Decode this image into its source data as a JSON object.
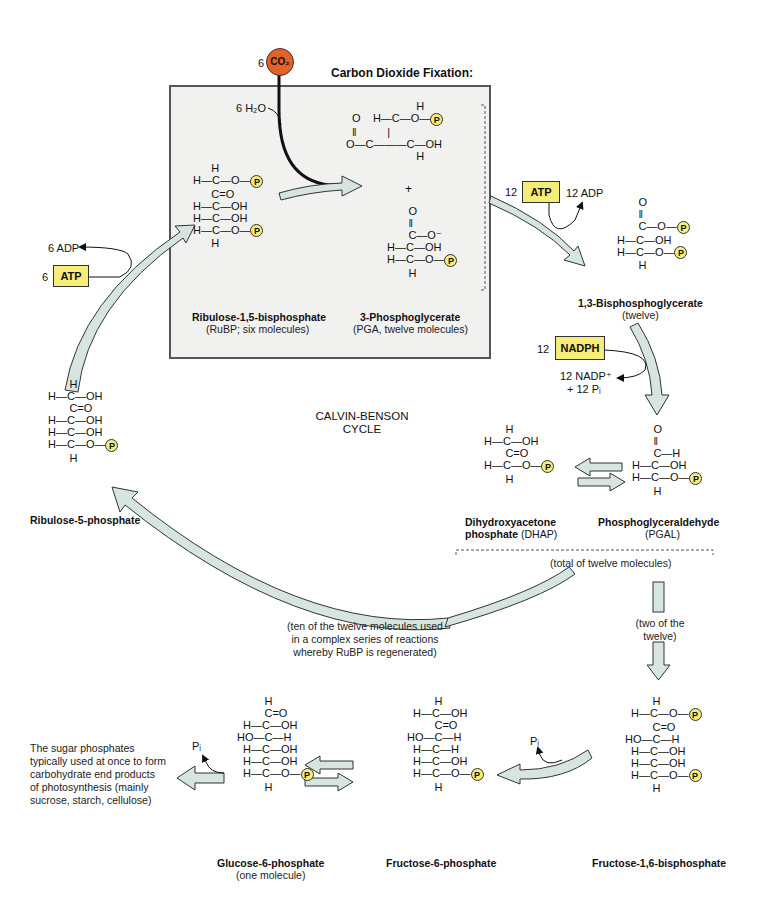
{
  "colors": {
    "arrow_fill": "#d6e5df",
    "arrow_stroke": "#333333",
    "phosphate": "#f5ec7a",
    "co2": "#e4622a",
    "box_bg": "#f1f1ef",
    "cofactor": "#f5ec7a"
  },
  "header": {
    "co2_coef": "6",
    "co2_label": "CO₂",
    "title": "Carbon Dioxide Fixation:",
    "h2o": "6 H₂O"
  },
  "center": {
    "line1": "CALVIN-BENSON",
    "line2": "CYCLE"
  },
  "phosphate_label": "P",
  "molecules": {
    "rubp": {
      "name": "Ribulose-1,5-bisphosphate",
      "sub": "(RuBP; six molecules)",
      "rows": [
        "      H",
        "H—C—O—",
        "     C=O",
        "H—C—OH",
        "H—C—OH",
        "H—C—O—",
        "      H"
      ]
    },
    "pga": {
      "name": "3-Phosphoglycerate",
      "sub": "(PGA, twelve molecules)",
      "plus": "+"
    },
    "bpg": {
      "name": "1,3-Bisphosphoglycerate",
      "sub": "(twelve)"
    },
    "dhap": {
      "name": "Dihydroxyacetone",
      "name2": "phosphate",
      "abbr": "(DHAP)"
    },
    "pgal": {
      "name": "Phosphoglyceraldehyde",
      "sub": "(PGAL)",
      "total": "(total of twelve molecules)"
    },
    "r5p": {
      "name": "Ribulose-5-phosphate"
    },
    "g6p": {
      "name": "Glucose-6-phosphate",
      "sub": "(one molecule)"
    },
    "f6p": {
      "name": "Fructose-6-phosphate"
    },
    "fbp": {
      "name": "Fructose-1,6-bisphosphate"
    }
  },
  "cofactors": {
    "atp12": {
      "coef": "12",
      "label": "ATP",
      "product": "12 ADP"
    },
    "nadph": {
      "coef": "12",
      "label": "NADPH",
      "product1": "12 NADP⁺",
      "product2": "+ 12 Pᵢ"
    },
    "atp6": {
      "coef": "6",
      "label": "ATP",
      "product": "6 ADP"
    }
  },
  "notes": {
    "regen": [
      "(ten of the twelve molecules used",
      "in a complex series of reactions",
      "whereby RuBP is regenerated)"
    ],
    "two": [
      "(two of the",
      "twelve)"
    ],
    "end": [
      "The sugar phosphates",
      "typically used at once to form",
      "carbohydrate end products",
      "of photosynthesis (mainly",
      "sucrose, starch, cellulose)"
    ],
    "pi_f": "Pᵢ",
    "pi_g": "Pᵢ"
  }
}
